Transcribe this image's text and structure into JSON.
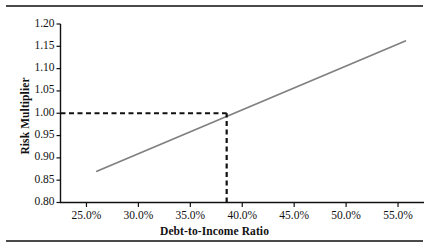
{
  "chart_data": {
    "type": "line",
    "title": "",
    "xlabel": "Debt-to-Income Ratio",
    "ylabel": "Risk Multiplier",
    "xlim": [
      22.5,
      57.5
    ],
    "ylim": [
      0.8,
      1.2
    ],
    "grid": false,
    "legend": null,
    "x_tick_labels": [
      "25.0%",
      "30.0%",
      "35.0%",
      "40.0%",
      "45.0%",
      "50.0%",
      "55.0%"
    ],
    "x_tick_values": [
      25.0,
      30.0,
      35.0,
      40.0,
      45.0,
      50.0,
      55.0
    ],
    "y_tick_labels": [
      "1.20",
      "1.15",
      "1.10",
      "1.05",
      "1.00",
      "0.95",
      "0.90",
      "0.85",
      "0.80"
    ],
    "y_tick_values": [
      1.2,
      1.15,
      1.1,
      1.05,
      1.0,
      0.95,
      0.9,
      0.85,
      0.8
    ],
    "series": [
      {
        "name": "Risk Multiplier",
        "color": "#808080",
        "style": "solid",
        "x": [
          26.0,
          55.7
        ],
        "values": [
          0.87,
          1.162
        ]
      }
    ],
    "annotations": [
      {
        "name": "reference-horizontal",
        "style": "dashed",
        "color": "#111111",
        "y": 1.0,
        "x_from": 22.5,
        "x_to": 38.5
      },
      {
        "name": "reference-vertical",
        "style": "dashed",
        "color": "#111111",
        "x": 38.5,
        "y_from": 0.8,
        "y_to": 1.0
      }
    ],
    "reference_point": {
      "x": 38.5,
      "y": 1.0
    }
  },
  "axes": {
    "x_title": "Debt-to-Income Ratio",
    "y_title": "Risk Multiplier"
  }
}
